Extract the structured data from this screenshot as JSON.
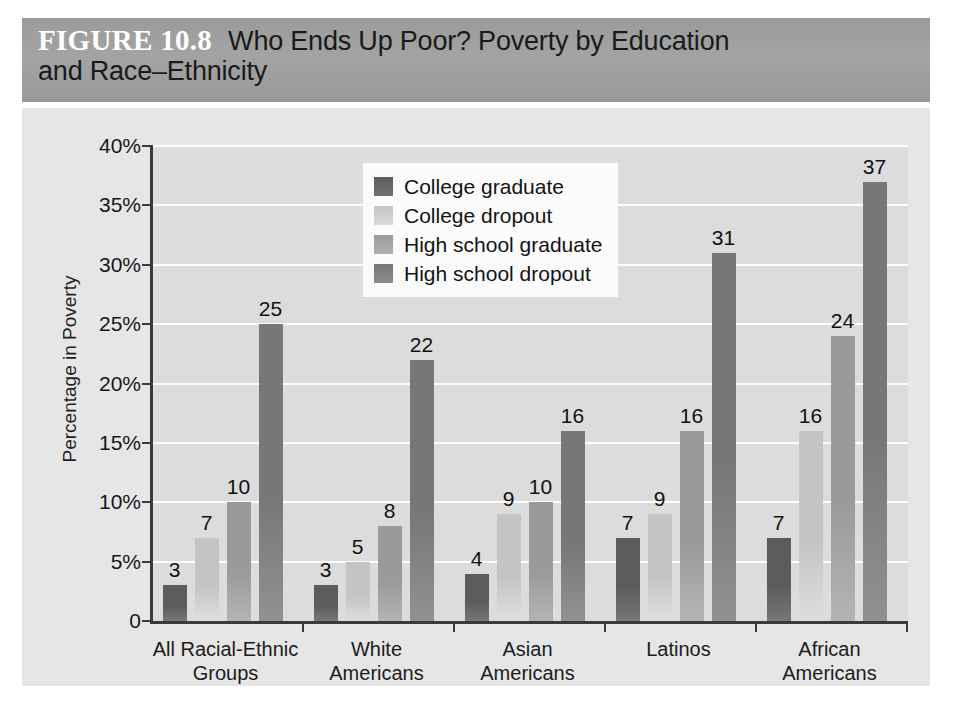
{
  "figure": {
    "label": "FIGURE 10.8",
    "title_line_1": "Who Ends Up Poor? Poverty by Education",
    "title_line_2": "and Race–Ethnicity",
    "banner_color": "#9e9e9e"
  },
  "chart_data": {
    "type": "bar",
    "title": "Who Ends Up Poor? Poverty by Education and Race–Ethnicity",
    "xlabel": "",
    "ylabel": "Percentage in Poverty",
    "ylim": [
      0,
      40
    ],
    "ytick_values": [
      0,
      5,
      10,
      15,
      20,
      25,
      30,
      35,
      40
    ],
    "ytick_labels": [
      "0",
      "5%",
      "10%",
      "15%",
      "20%",
      "25%",
      "30%",
      "35%",
      "40%"
    ],
    "grid": true,
    "legend_position": "top-center",
    "categories": [
      "All Racial-Ethnic Groups",
      "White Americans",
      "Asian Americans",
      "Latinos",
      "African Americans"
    ],
    "category_lines": [
      [
        "All Racial-Ethnic",
        "Groups"
      ],
      [
        "White",
        "Americans"
      ],
      [
        "Asian",
        "Americans"
      ],
      [
        "Latinos",
        ""
      ],
      [
        "African",
        "Americans"
      ]
    ],
    "series": [
      {
        "name": "College graduate",
        "color": "#5c5c5c",
        "values": [
          3,
          3,
          4,
          7,
          7
        ]
      },
      {
        "name": "College dropout",
        "color": "#c4c4c4",
        "values": [
          7,
          5,
          9,
          9,
          16
        ]
      },
      {
        "name": "High school graduate",
        "color": "#9a9a9a",
        "values": [
          10,
          8,
          10,
          16,
          24
        ]
      },
      {
        "name": "High school dropout",
        "color": "#777777",
        "values": [
          25,
          22,
          16,
          31,
          37
        ]
      }
    ],
    "plot_background": "#dcdcdc",
    "gridline_color": "#ffffff",
    "panel_background": "#e6e6e6"
  }
}
